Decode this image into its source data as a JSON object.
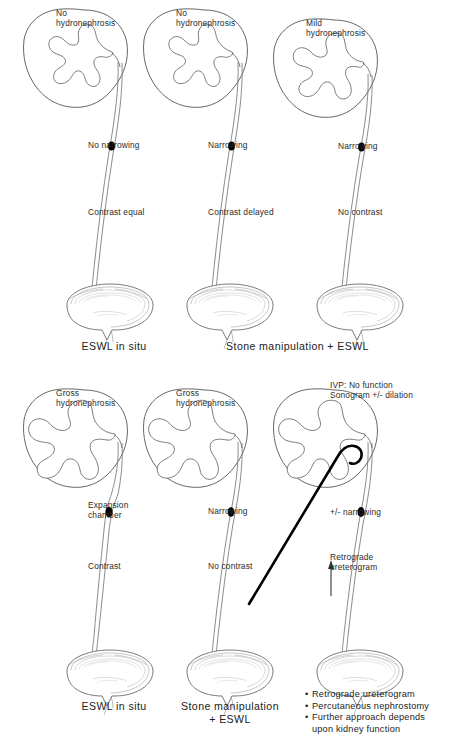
{
  "figure": {
    "title_present": false,
    "rows": [
      {
        "id": "top-row",
        "caption_groups": [
          {
            "id": "caption-eswl-in-situ-top",
            "text": "ESWL in situ"
          },
          {
            "id": "caption-stone-manipulation-top",
            "text": "Stone manipulation + ESWL"
          }
        ],
        "panels": [
          {
            "id": "panel-1",
            "kidney_state": "normal",
            "labels": {
              "kidney": "No\nhydronephrosis",
              "stone": "No narrowing",
              "contrast": "Contrast equal"
            }
          },
          {
            "id": "panel-2",
            "kidney_state": "normal",
            "labels": {
              "kidney": "No\nhydronephrosis",
              "stone": "Narrowing",
              "contrast": "Contrast delayed"
            }
          },
          {
            "id": "panel-3",
            "kidney_state": "mild-hydronephrosis",
            "labels": {
              "kidney": "Mild\nhydronephrosis",
              "stone": "Narrowing",
              "contrast": "No contrast"
            }
          }
        ]
      },
      {
        "id": "bottom-row",
        "caption_groups": [
          {
            "id": "caption-eswl-in-situ-bottom",
            "text": "ESWL in situ"
          },
          {
            "id": "caption-stone-manipulation-bottom",
            "text": "Stone manipulation\n+ ESWL"
          }
        ],
        "panels": [
          {
            "id": "panel-4",
            "kidney_state": "gross-hydronephrosis",
            "labels": {
              "kidney": "Gross\nhydronephrosis",
              "stone": "Expansion\nchamber",
              "contrast": "Contrast"
            }
          },
          {
            "id": "panel-5",
            "kidney_state": "gross-hydronephrosis",
            "labels": {
              "kidney": "Gross\nhydronephrosis",
              "stone": "Narrowing",
              "contrast": "No contrast"
            }
          },
          {
            "id": "panel-6",
            "kidney_state": "nephrostomy",
            "labels": {
              "kidney": "IVP: No function\nSonogram +/- dilation",
              "stone": "+/- narrowing",
              "contrast": "Retrograde\nureterogram"
            },
            "bullets": [
              "Retrograde ureterogram",
              "Percutaneous nephrostomy",
              "Further approach depends",
              "upon kidney function"
            ]
          }
        ]
      }
    ]
  },
  "colors": {
    "ink": "#1a1a1a",
    "outline": "#4a4a4a",
    "faint": "#9a9a9a",
    "stone": "#000000",
    "background": "#ffffff"
  }
}
